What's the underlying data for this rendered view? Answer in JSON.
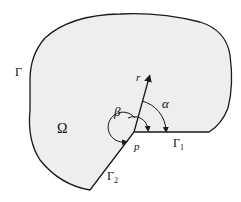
{
  "diagram": {
    "region_label": "Ω",
    "boundary_label": "Γ",
    "gamma1_label": "Γ",
    "gamma1_sub": "1",
    "gamma2_label": "Γ",
    "gamma2_sub": "2",
    "point_label": "p",
    "ray_label": "r",
    "angle_alpha_label": "α",
    "angle_beta_label": "β",
    "colors": {
      "fill": "#eeeeee",
      "stroke": "#1a1a1a"
    }
  }
}
